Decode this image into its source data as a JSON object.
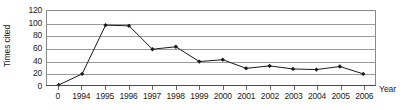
{
  "chart_data": {
    "type": "line",
    "title": "",
    "xlabel": "Year",
    "ylabel": "Times cited",
    "ylim": [
      0,
      120
    ],
    "yticks": [
      0,
      20,
      40,
      60,
      80,
      100,
      120
    ],
    "grid": true,
    "legend": "none",
    "marker": "filled-diamond",
    "line_color": "#1a1a1a",
    "grid_color": "#9a9a9a",
    "categories": [
      "0",
      "1994",
      "1995",
      "1996",
      "1997",
      "1998",
      "1999",
      "2000",
      "2001",
      "2002",
      "2003",
      "2004",
      "2005",
      "2006"
    ],
    "values": [
      0,
      18,
      97,
      96,
      58,
      62,
      38,
      41,
      27,
      31,
      26,
      25,
      30,
      18
    ],
    "series": [
      {
        "name": "Times cited",
        "values": [
          0,
          18,
          97,
          96,
          58,
          62,
          38,
          41,
          27,
          31,
          26,
          25,
          30,
          18
        ]
      }
    ]
  },
  "axes": {
    "y_title": "Times cited",
    "x_title": "Year",
    "y_tick_labels": [
      "120",
      "100",
      "80",
      "60",
      "40",
      "20",
      "0"
    ],
    "x_tick_labels": [
      "0",
      "1994",
      "1995",
      "1996",
      "1997",
      "1998",
      "1999",
      "2000",
      "2001",
      "2002",
      "2003",
      "2004",
      "2005",
      "2006"
    ]
  }
}
